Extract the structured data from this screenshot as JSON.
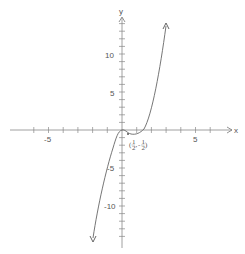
{
  "chart_data": {
    "type": "line",
    "title": "",
    "xlabel": "x",
    "ylabel": "y",
    "xlim": [
      -7.5,
      8
    ],
    "ylim": [
      -14.5,
      15
    ],
    "x_tick_labels": [
      "-5",
      "5"
    ],
    "y_tick_labels": [
      "10",
      "5",
      "-5",
      "-10"
    ],
    "x_ticks": [
      -6,
      -5,
      -4,
      -3,
      -2,
      -1,
      1,
      2,
      3,
      4,
      5,
      6
    ],
    "y_ticks": [
      -14,
      -13,
      -12,
      -11,
      -10,
      -9,
      -8,
      -7,
      -6,
      -5,
      -4,
      -3,
      -2,
      -1,
      1,
      2,
      3,
      4,
      5,
      6,
      7,
      8,
      9,
      10,
      11,
      12,
      13,
      14
    ],
    "grid": false,
    "series": [
      {
        "name": "cubic curve",
        "description": "Cubic with local maximum at origin and local minimum at (1/2, -1/2), arrows at both ends",
        "x": [
          -2.0,
          -1.5,
          -1.0,
          -0.5,
          0,
          0.25,
          0.5,
          0.75,
          1.0,
          1.5,
          2.0,
          2.9
        ],
        "y": [
          -14.5,
          -10.5,
          -6.0,
          -2.0,
          0,
          -0.3,
          -0.5,
          -0.35,
          0,
          3.0,
          7.5,
          14.0
        ]
      }
    ],
    "annotations": [
      {
        "text": "(1/2, -1/2)",
        "x": 0.5,
        "y": -0.5,
        "label_numerators": [
          "1",
          "1"
        ],
        "label_denominators": [
          "2",
          "2"
        ]
      }
    ]
  },
  "axes": {
    "x_label": "x",
    "y_label": "y",
    "x_tick_labels": {
      "neg5": "-5",
      "pos5": "5"
    },
    "y_tick_labels": {
      "pos10": "10",
      "pos5": "5",
      "neg5": "-5",
      "neg10": "-10"
    }
  },
  "annotation": {
    "open": "(",
    "n1": "1",
    "d1": "2",
    "comma": ",",
    "minus": "-",
    "n2": "1",
    "d2": "2",
    "close": ")"
  },
  "colors": {
    "axis": "#777777",
    "curve": "#666666",
    "text": "#555555"
  }
}
